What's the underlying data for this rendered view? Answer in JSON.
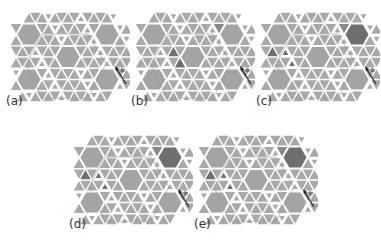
{
  "figure": {
    "colors": {
      "tile": "#a9a9a9",
      "tile_dark": "#6f6f6f",
      "tile_mid": "#8a8a8a",
      "hexagon": "#a4a4a4",
      "gap": "#ffffff",
      "arrow": "#222222"
    },
    "arrow_label": "b",
    "panels": [
      {
        "id": "a",
        "label": "(a)",
        "x": 2,
        "y": 2,
        "dark_tiles": [],
        "mid_tiles": [],
        "dark_hex": []
      },
      {
        "id": "b",
        "label": "(b)",
        "x": 127,
        "y": 2,
        "dark_tiles": [
          [
            3,
            5
          ],
          [
            4,
            6
          ]
        ],
        "mid_tiles": [
          [
            1,
            12
          ]
        ],
        "dark_hex": []
      },
      {
        "id": "c",
        "label": "(c)",
        "x": 252,
        "y": 2,
        "dark_tiles": [
          [
            3,
            1
          ],
          [
            3,
            3
          ],
          [
            4,
            4
          ]
        ],
        "mid_tiles": [
          [
            1,
            12
          ]
        ],
        "dark_hex": [
          [
            1,
            14
          ]
        ]
      },
      {
        "id": "d",
        "label": "(d)",
        "x": 65,
        "y": 125,
        "dark_tiles": [
          [
            3,
            1
          ],
          [
            3,
            3
          ],
          [
            4,
            4
          ]
        ],
        "mid_tiles": [
          [
            1,
            12
          ]
        ],
        "dark_hex": [
          [
            1,
            14
          ]
        ]
      },
      {
        "id": "e",
        "label": "(e)",
        "x": 190,
        "y": 125,
        "dark_tiles": [
          [
            3,
            1
          ],
          [
            3,
            3
          ],
          [
            4,
            4
          ]
        ],
        "mid_tiles": [
          [
            1,
            12
          ]
        ],
        "dark_hex": [
          [
            1,
            14
          ]
        ]
      }
    ]
  }
}
